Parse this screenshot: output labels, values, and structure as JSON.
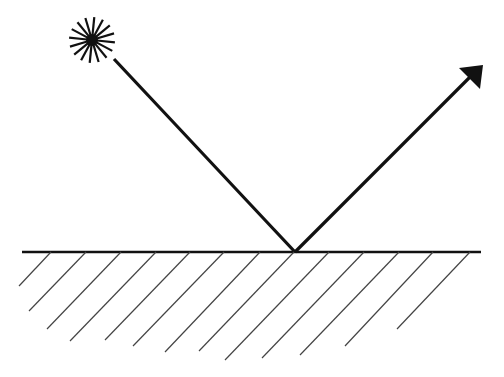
{
  "diagram": {
    "background": "#ffffff",
    "stroke_color": "#111111",
    "hatch_color": "#444444",
    "light_source": {
      "icon": "sun-burst-icon",
      "cx": 92,
      "cy": 40,
      "rays": 16,
      "inner_r": 5,
      "outer_r": 23
    },
    "incident_ray": {
      "x1": 114,
      "y1": 59,
      "x2": 295,
      "y2": 252
    },
    "reflected_ray": {
      "x1": 295,
      "y1": 252,
      "x2": 472,
      "y2": 75,
      "arrow_tip": [
        483,
        65
      ]
    },
    "surface": {
      "x1": 22,
      "y1": 252,
      "x2": 481,
      "y2": 252
    },
    "hatches": [
      {
        "x1": 51,
        "y1": 252,
        "x2": 19,
        "y2": 286
      },
      {
        "x1": 86,
        "y1": 252,
        "x2": 29,
        "y2": 311
      },
      {
        "x1": 121,
        "y1": 252,
        "x2": 47,
        "y2": 329
      },
      {
        "x1": 156,
        "y1": 252,
        "x2": 70,
        "y2": 341
      },
      {
        "x1": 190,
        "y1": 252,
        "x2": 105,
        "y2": 340
      },
      {
        "x1": 224,
        "y1": 252,
        "x2": 133,
        "y2": 346
      },
      {
        "x1": 260,
        "y1": 252,
        "x2": 165,
        "y2": 352
      },
      {
        "x1": 294,
        "y1": 252,
        "x2": 199,
        "y2": 351
      },
      {
        "x1": 329,
        "y1": 252,
        "x2": 225,
        "y2": 360
      },
      {
        "x1": 364,
        "y1": 252,
        "x2": 262,
        "y2": 358
      },
      {
        "x1": 399,
        "y1": 252,
        "x2": 300,
        "y2": 355
      },
      {
        "x1": 433,
        "y1": 252,
        "x2": 345,
        "y2": 346
      },
      {
        "x1": 470,
        "y1": 252,
        "x2": 397,
        "y2": 329
      }
    ]
  }
}
